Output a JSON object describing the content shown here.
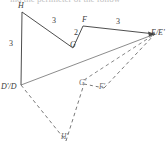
{
  "figure": {
    "prompt_text": "ind the perimeter of the follow",
    "stroke_color": "#3a3a3a",
    "dashed_color": "#6a6a6a",
    "background_color": "#ffffff",
    "preimage": {
      "name": "DHGFE",
      "vertices": [
        {
          "id": "H",
          "label": "H",
          "x": 22,
          "y": 12,
          "label_x": 18,
          "label_y": 3
        },
        {
          "id": "G",
          "label": "G",
          "x": 73,
          "y": 48,
          "label_x": 70,
          "label_y": 40
        },
        {
          "id": "F",
          "label": "F",
          "x": 83,
          "y": 26,
          "label_x": 82,
          "label_y": 17
        },
        {
          "id": "E",
          "label": "E/E'",
          "x": 155,
          "y": 34,
          "label_x": 152,
          "label_y": 30
        },
        {
          "id": "D",
          "label": "D'/D",
          "x": 21,
          "y": 85,
          "label_x": 2,
          "label_y": 84
        }
      ],
      "side_lengths": [
        {
          "between": "D-H",
          "value": "3",
          "x": 10,
          "y": 42
        },
        {
          "between": "H-G",
          "value": "3",
          "x": 53,
          "y": 20
        },
        {
          "between": "G-F",
          "value": "2",
          "x": 76,
          "y": 30
        },
        {
          "between": "F-E",
          "value": "3",
          "x": 117,
          "y": 20
        }
      ]
    },
    "image": {
      "name": "D'H'G'F'E'",
      "vertices": [
        {
          "id": "Dp",
          "label": "D'/D",
          "x": 21,
          "y": 85,
          "label_x": 2,
          "label_y": 84
        },
        {
          "id": "Hp",
          "label": "H'",
          "x": 66,
          "y": 141,
          "label_x": 62,
          "label_y": 134
        },
        {
          "id": "Gp",
          "label": "G'",
          "x": 84,
          "y": 84,
          "label_x": 80,
          "label_y": 80
        },
        {
          "id": "Fp",
          "label": "F'",
          "x": 104,
          "y": 88,
          "label_x": 100,
          "label_y": 84
        },
        {
          "id": "Ep",
          "label": "E/E'",
          "x": 155,
          "y": 34,
          "label_x": 152,
          "label_y": 30
        }
      ]
    }
  }
}
